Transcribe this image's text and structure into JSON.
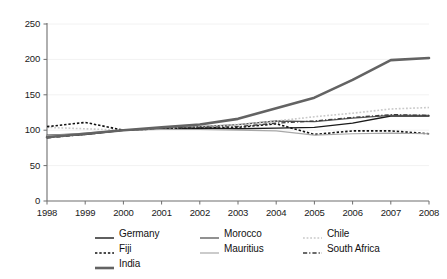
{
  "chart_data": {
    "type": "line",
    "title": "",
    "xlabel": "",
    "ylabel": "",
    "x": [
      1998,
      1999,
      2000,
      2001,
      2002,
      2003,
      2004,
      2005,
      2006,
      2007,
      2008
    ],
    "xtick_labels": [
      "1998",
      "1999",
      "2000",
      "2001",
      "2002",
      "2003",
      "2004",
      "2005",
      "2006",
      "2007",
      "2008"
    ],
    "ytick_labels": [
      "0",
      "50",
      "100",
      "150",
      "200",
      "250"
    ],
    "ytick_values": [
      0,
      50,
      100,
      150,
      200,
      250
    ],
    "ylim": [
      0,
      250
    ],
    "xlim": [
      1998,
      2008
    ],
    "grid": true,
    "legend_position": "bottom",
    "series": [
      {
        "name": "Germany",
        "color": "#1a1a1a",
        "style": "solid",
        "width": 1.4,
        "values": [
          91,
          94,
          100,
          102,
          103,
          102,
          103,
          104,
          110,
          120,
          120
        ]
      },
      {
        "name": "Morocco",
        "color": "#555555",
        "style": "solid",
        "width": 1.3,
        "values": [
          93,
          95,
          100,
          103,
          105,
          108,
          113,
          112,
          117,
          121,
          121
        ]
      },
      {
        "name": "Chile",
        "color": "#c9c9c9",
        "style": "dotted",
        "width": 1.6,
        "values": [
          104,
          102,
          100,
          102,
          105,
          108,
          113,
          119,
          124,
          130,
          132
        ]
      },
      {
        "name": "Fiji",
        "color": "#111111",
        "style": "dashed",
        "width": 1.6,
        "values": [
          105,
          111,
          100,
          102,
          103,
          104,
          109,
          94,
          99,
          99,
          95
        ]
      },
      {
        "name": "Mauritius",
        "color": "#a8a8a8",
        "style": "solid",
        "width": 1.2,
        "values": [
          92,
          96,
          100,
          101,
          101,
          100,
          99,
          93,
          95,
          96,
          95
        ]
      },
      {
        "name": "South Africa",
        "color": "#3a3a3a",
        "style": "dashdot",
        "width": 1.3,
        "values": [
          89,
          94,
          100,
          103,
          104,
          105,
          110,
          113,
          118,
          122,
          121
        ]
      },
      {
        "name": "India",
        "color": "#636363",
        "style": "solid",
        "width": 2.6,
        "values": [
          90,
          95,
          100,
          104,
          108,
          116,
          131,
          146,
          171,
          199,
          202
        ]
      }
    ]
  },
  "axis": {
    "y_axis_name": "value-axis",
    "x_axis_name": "year-axis"
  },
  "legend": {
    "rows": [
      [
        "Germany",
        "Morocco",
        "Chile"
      ],
      [
        "Fiji",
        "Mauritius",
        "South Africa"
      ],
      [
        "India"
      ]
    ]
  }
}
